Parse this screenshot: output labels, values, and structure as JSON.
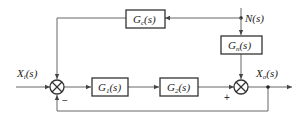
{
  "diagram": {
    "type": "block-diagram",
    "signals": {
      "input": {
        "main": "X",
        "sub": "i",
        "arg": "(s)"
      },
      "output": {
        "main": "X",
        "sub": "o",
        "arg": "(s)"
      },
      "disturbance": {
        "main": "N",
        "sub": "",
        "arg": "(s)"
      }
    },
    "blocks": [
      {
        "id": "gc",
        "main": "G",
        "sub": "c",
        "arg": "(s)"
      },
      {
        "id": "gn",
        "main": "G",
        "sub": "n",
        "arg": "(s)"
      },
      {
        "id": "g1",
        "main": "G",
        "sub": "1",
        "arg": "(s)"
      },
      {
        "id": "g2",
        "main": "G",
        "sub": "2",
        "arg": "(s)"
      }
    ],
    "signs": {
      "junction1_bottom": "−",
      "junction2_left": "+"
    },
    "colors": {
      "line": "#666666",
      "box": "#333333",
      "text": "#222222"
    }
  }
}
